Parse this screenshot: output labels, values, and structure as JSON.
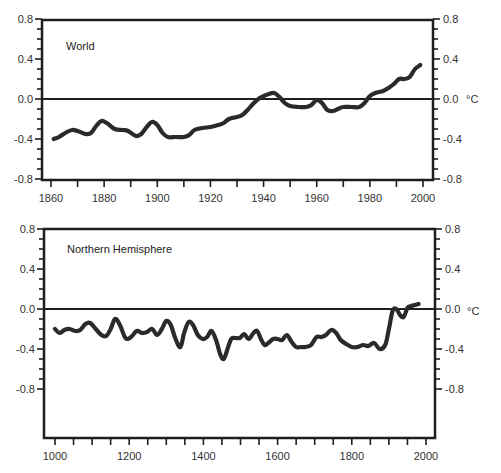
{
  "chart_data": [
    {
      "type": "line",
      "title": "World",
      "xlabel": "",
      "ylabel": "°C",
      "xlim": [
        1860,
        2000
      ],
      "ylim": [
        -0.8,
        0.8
      ],
      "x_ticks": [
        1860,
        1880,
        1900,
        1920,
        1940,
        1960,
        1980,
        2000
      ],
      "y_ticks": [
        "0.8",
        "0.4",
        "0.0",
        "-0.4",
        "-0.8"
      ],
      "y_tick_values": [
        0.8,
        0.4,
        0.0,
        -0.4,
        -0.8
      ],
      "grid": false,
      "zero_line": true,
      "series": [
        {
          "name": "World temperature anomaly",
          "x": [
            1861,
            1863,
            1866,
            1868,
            1870,
            1873,
            1875,
            1877,
            1879,
            1881,
            1884,
            1887,
            1889,
            1892,
            1894,
            1896,
            1898,
            1900,
            1902,
            1904,
            1907,
            1910,
            1912,
            1914,
            1917,
            1920,
            1923,
            1925,
            1927,
            1930,
            1932,
            1934,
            1936,
            1938,
            1940,
            1942,
            1944,
            1946,
            1948,
            1950,
            1953,
            1956,
            1958,
            1960,
            1962,
            1964,
            1966,
            1968,
            1970,
            1973,
            1976,
            1978,
            1980,
            1982,
            1985,
            1987,
            1989,
            1991,
            1993,
            1995,
            1997,
            1999
          ],
          "values": [
            -0.4,
            -0.38,
            -0.33,
            -0.31,
            -0.32,
            -0.35,
            -0.34,
            -0.27,
            -0.22,
            -0.24,
            -0.3,
            -0.31,
            -0.32,
            -0.37,
            -0.35,
            -0.28,
            -0.23,
            -0.26,
            -0.34,
            -0.38,
            -0.38,
            -0.38,
            -0.36,
            -0.31,
            -0.29,
            -0.28,
            -0.26,
            -0.24,
            -0.2,
            -0.18,
            -0.16,
            -0.11,
            -0.05,
            0.0,
            0.03,
            0.05,
            0.06,
            0.02,
            -0.04,
            -0.07,
            -0.08,
            -0.08,
            -0.06,
            -0.01,
            -0.04,
            -0.11,
            -0.12,
            -0.1,
            -0.08,
            -0.08,
            -0.08,
            -0.04,
            0.03,
            0.06,
            0.08,
            0.11,
            0.15,
            0.2,
            0.2,
            0.22,
            0.3,
            0.34
          ]
        }
      ]
    },
    {
      "type": "line",
      "title": "Northern Hemisphere",
      "xlabel": "",
      "ylabel": "°C",
      "xlim": [
        1000,
        2000
      ],
      "ylim": [
        -1.0,
        0.8
      ],
      "x_ticks": [
        1000,
        1200,
        1400,
        1600,
        1800,
        2000
      ],
      "y_ticks": [
        "0.8",
        "0.4",
        "0.0",
        "-0.4",
        "-0.8"
      ],
      "y_tick_values": [
        0.8,
        0.4,
        0.0,
        -0.4,
        -0.8
      ],
      "grid": false,
      "zero_line": true,
      "series": [
        {
          "name": "Northern Hemisphere temperature anomaly",
          "x": [
            1000,
            1012,
            1025,
            1040,
            1055,
            1068,
            1082,
            1095,
            1110,
            1125,
            1138,
            1150,
            1162,
            1175,
            1190,
            1205,
            1220,
            1235,
            1248,
            1262,
            1275,
            1288,
            1300,
            1312,
            1325,
            1338,
            1348,
            1360,
            1372,
            1385,
            1398,
            1410,
            1422,
            1435,
            1445,
            1455,
            1465,
            1475,
            1485,
            1498,
            1510,
            1522,
            1535,
            1545,
            1555,
            1565,
            1575,
            1588,
            1600,
            1612,
            1625,
            1638,
            1650,
            1662,
            1675,
            1690,
            1705,
            1718,
            1730,
            1745,
            1758,
            1770,
            1785,
            1800,
            1815,
            1830,
            1845,
            1860,
            1875,
            1890,
            1900,
            1910,
            1920,
            1930,
            1940,
            1950,
            1960,
            1970,
            1980
          ],
          "values": [
            -0.2,
            -0.24,
            -0.21,
            -0.2,
            -0.22,
            -0.21,
            -0.15,
            -0.14,
            -0.2,
            -0.26,
            -0.27,
            -0.2,
            -0.1,
            -0.16,
            -0.29,
            -0.28,
            -0.22,
            -0.24,
            -0.23,
            -0.2,
            -0.26,
            -0.2,
            -0.12,
            -0.16,
            -0.3,
            -0.38,
            -0.24,
            -0.13,
            -0.16,
            -0.26,
            -0.3,
            -0.28,
            -0.22,
            -0.32,
            -0.45,
            -0.5,
            -0.4,
            -0.3,
            -0.29,
            -0.29,
            -0.25,
            -0.3,
            -0.24,
            -0.22,
            -0.3,
            -0.36,
            -0.34,
            -0.3,
            -0.3,
            -0.31,
            -0.26,
            -0.33,
            -0.38,
            -0.38,
            -0.38,
            -0.36,
            -0.28,
            -0.28,
            -0.26,
            -0.21,
            -0.24,
            -0.31,
            -0.35,
            -0.38,
            -0.38,
            -0.36,
            -0.37,
            -0.34,
            -0.4,
            -0.36,
            -0.2,
            -0.02,
            0.0,
            -0.06,
            -0.08,
            0.01,
            0.03,
            0.04,
            0.05
          ]
        }
      ]
    }
  ],
  "panels": {
    "top": {
      "label": "World",
      "unit": "°C",
      "x_tick_labels": [
        "1860",
        "1880",
        "1900",
        "1920",
        "1940",
        "1960",
        "1980",
        "2000"
      ],
      "y_tick_labels": [
        "0.8",
        "0.4",
        "0.0",
        "-0.4",
        "-0.8"
      ]
    },
    "bottom": {
      "label": "Northern Hemisphere",
      "unit": "°C",
      "x_tick_labels": [
        "1000",
        "1200",
        "1400",
        "1600",
        "1800",
        "2000"
      ],
      "y_tick_labels": [
        "0.8",
        "0.4",
        "0.0",
        "-0.4",
        "-0.8"
      ]
    }
  },
  "colors": {
    "line": "#2a2a2a",
    "axis": "#1e1e1e",
    "text": "#333333",
    "background": "#ffffff"
  }
}
